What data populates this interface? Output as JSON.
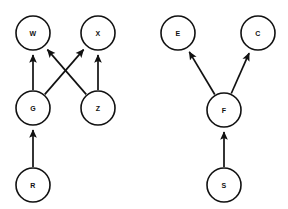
{
  "diagram": {
    "type": "directed-graph",
    "title": "",
    "background_color": "#ffffff",
    "node_fill_color": "#ffffff",
    "node_stroke_color": "#111111",
    "edge_color": "#111111",
    "node_radius": 17,
    "graphs": [
      {
        "id": "left-graph",
        "name": "left-graph",
        "nodes": [
          {
            "id": "W",
            "label": "W",
            "cx": 33,
            "cy": 33
          },
          {
            "id": "X",
            "label": "X",
            "cx": 98,
            "cy": 33
          },
          {
            "id": "G",
            "label": "G",
            "cx": 33,
            "cy": 108
          },
          {
            "id": "Z",
            "label": "Z",
            "cx": 98,
            "cy": 108
          },
          {
            "id": "R",
            "label": "R",
            "cx": 33,
            "cy": 185
          }
        ],
        "edges": [
          {
            "id": "G-W",
            "from": "G",
            "to": "W",
            "directed": true
          },
          {
            "id": "G-X",
            "from": "G",
            "to": "X",
            "directed": true
          },
          {
            "id": "Z-W",
            "from": "Z",
            "to": "W",
            "directed": true
          },
          {
            "id": "Z-X",
            "from": "Z",
            "to": "X",
            "directed": true
          },
          {
            "id": "R-G",
            "from": "R",
            "to": "G",
            "directed": true
          }
        ]
      },
      {
        "id": "right-graph",
        "name": "right-graph",
        "nodes": [
          {
            "id": "E",
            "label": "E",
            "cx": 178,
            "cy": 33
          },
          {
            "id": "C",
            "label": "C",
            "cx": 258,
            "cy": 33
          },
          {
            "id": "F",
            "label": "F",
            "cx": 224,
            "cy": 110
          },
          {
            "id": "S",
            "label": "S",
            "cx": 224,
            "cy": 185
          }
        ],
        "edges": [
          {
            "id": "F-E",
            "from": "F",
            "to": "E",
            "directed": true
          },
          {
            "id": "F-C",
            "from": "F",
            "to": "C",
            "directed": true
          },
          {
            "id": "S-F",
            "from": "S",
            "to": "F",
            "directed": true
          }
        ]
      }
    ]
  }
}
